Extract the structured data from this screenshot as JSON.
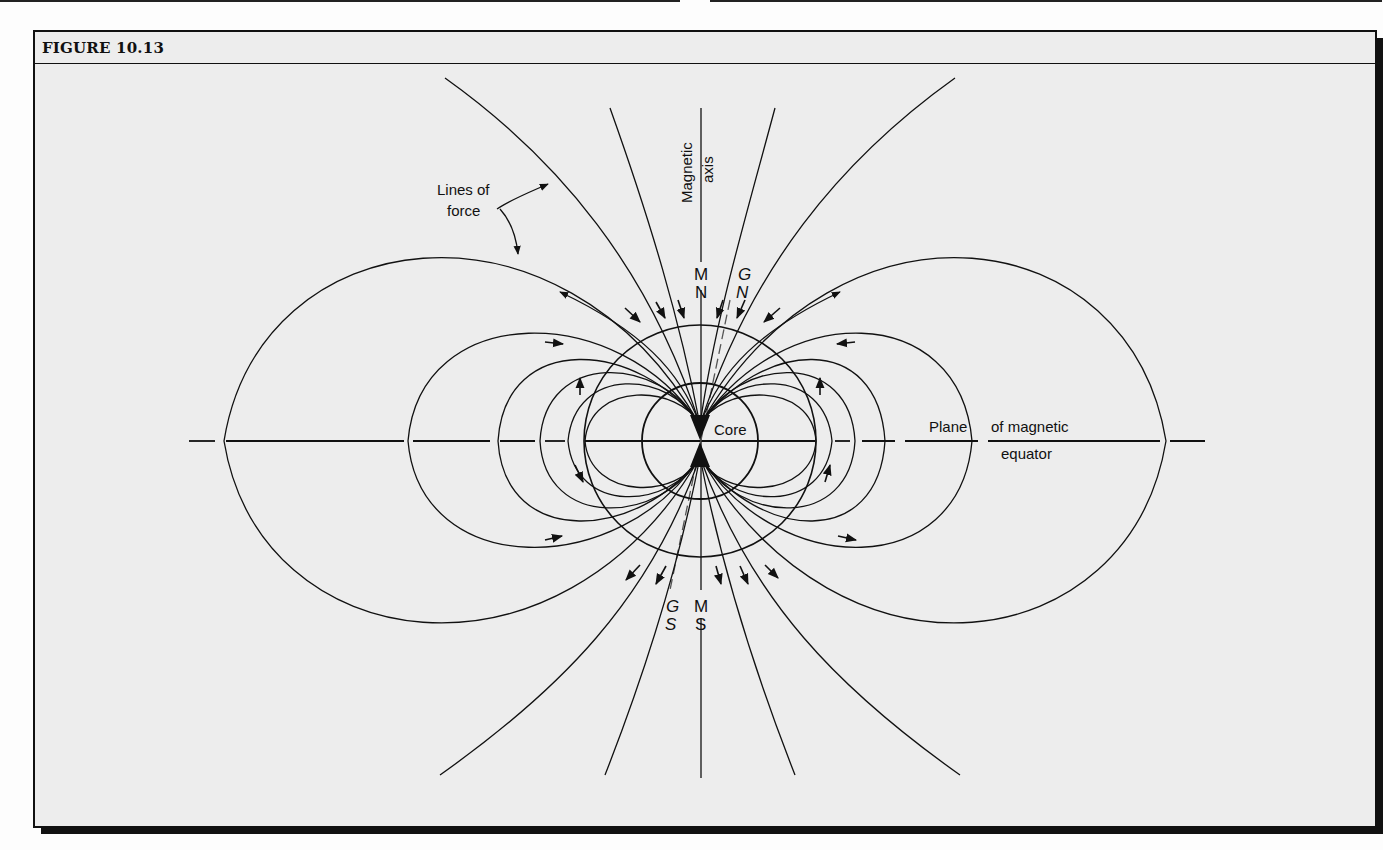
{
  "figure": {
    "title": "FIGURE 10.13"
  },
  "labels": {
    "lines_of_force_1": "Lines of",
    "lines_of_force_2": "force",
    "magnetic_axis_1": "Magnetic",
    "magnetic_axis_2": "axis",
    "magnetic_north_m": "M",
    "magnetic_north_n": "N",
    "geographic_north_g": "G",
    "geographic_north_n": "N",
    "magnetic_south_m": "M",
    "magnetic_south_s": "S",
    "geographic_south_g": "G",
    "geographic_south_s": "S",
    "core": "Core",
    "equator_1": "Plane",
    "equator_2": "of magnetic",
    "equator_3": "equator"
  },
  "colors": {
    "background": "#ededed",
    "ink": "#111111"
  }
}
